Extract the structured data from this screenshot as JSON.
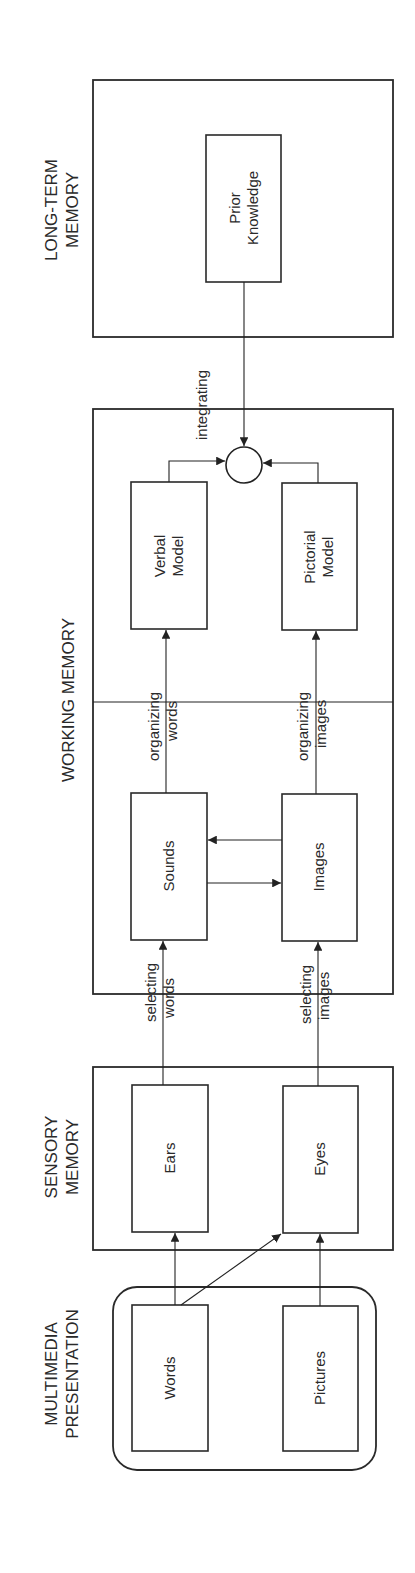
{
  "sections": {
    "multimedia": {
      "line1": "MULTIMEDIA",
      "line2": "PRESENTATION"
    },
    "sensory": {
      "line1": "SENSORY",
      "line2": "MEMORY"
    },
    "working": {
      "line1": "WORKING MEMORY"
    },
    "longterm": {
      "line1": "LONG-TERM",
      "line2": "MEMORY"
    }
  },
  "nodes": {
    "words": "Words",
    "pictures": "Pictures",
    "ears": "Ears",
    "eyes": "Eyes",
    "sounds": "Sounds",
    "images": "Images",
    "verbal_model": {
      "line1": "Verbal",
      "line2": "Model"
    },
    "pictorial_model": {
      "line1": "Pictorial",
      "line2": "Model"
    },
    "prior_knowledge": {
      "line1": "Prior",
      "line2": "Knowledge"
    }
  },
  "processes": {
    "selecting_words": {
      "line1": "selecting",
      "line2": "words"
    },
    "selecting_images": {
      "line1": "selecting",
      "line2": "images"
    },
    "organizing_words": {
      "line1": "organizing",
      "line2": "words"
    },
    "organizing_images": {
      "line1": "organizing",
      "line2": "images"
    },
    "integrating": "integrating"
  },
  "colors": {
    "ink": "#2a2a2a",
    "background": "#ffffff"
  }
}
